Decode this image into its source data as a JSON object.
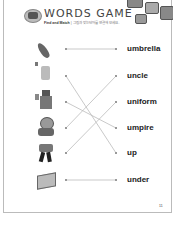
{
  "header": {
    "title": "WORDS GAME",
    "instruction_bold": "Find and Match",
    "instruction_text": "| 그림과 맞는 단어를 연결해 보세요."
  },
  "pictures": [
    {
      "name": "umbrella-closed",
      "row": 1
    },
    {
      "name": "hand-with-letters",
      "row": 2
    },
    {
      "name": "man-holding-card",
      "row": 3
    },
    {
      "name": "round-man-with-cap",
      "row": 4
    },
    {
      "name": "boy-running",
      "row": 5
    },
    {
      "name": "table-box",
      "row": 6
    }
  ],
  "words": [
    "umbrella",
    "uncle",
    "uniform",
    "umpire",
    "up",
    "under"
  ],
  "connections": [
    {
      "from_row": 1,
      "to_word": "umbrella"
    },
    {
      "from_row": 2,
      "to_word": "up"
    },
    {
      "from_row": 3,
      "to_word": "umpire"
    },
    {
      "from_row": 4,
      "to_word": "uncle"
    },
    {
      "from_row": 5,
      "to_word": "uniform"
    },
    {
      "from_row": 6,
      "to_word": "under"
    }
  ],
  "page_number": "11",
  "colors": {
    "line": "#bbbbbb",
    "dot": "#999999",
    "text": "#222222"
  }
}
